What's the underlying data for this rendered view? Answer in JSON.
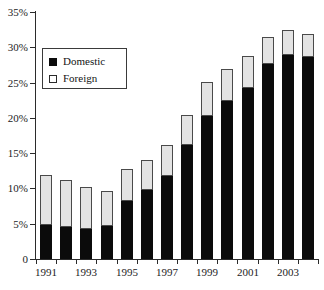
{
  "chart_data": {
    "type": "bar",
    "subtype": "stacked-vertical",
    "title": "",
    "subtitle": "",
    "xlabel": "",
    "ylabel": "",
    "ylim": [
      0,
      35
    ],
    "ytick_values": [
      0,
      5,
      10,
      15,
      20,
      25,
      30,
      35
    ],
    "ytick_labels": [
      "0",
      "5%",
      "10%",
      "15%",
      "20%",
      "25%",
      "30%",
      "35%"
    ],
    "grid": false,
    "legend_position": "upper-left-inside",
    "categories": [
      "1991",
      "1992",
      "1993",
      "1994",
      "1995",
      "1996",
      "1997",
      "1998",
      "1999",
      "2000",
      "2001",
      "2002",
      "2003",
      "2004"
    ],
    "xtick_labels_shown": [
      "1991",
      "1993",
      "1995",
      "1997",
      "1999",
      "2001",
      "2003"
    ],
    "series": [
      {
        "name": "Domestic",
        "color": "#0b0b0b",
        "values": [
          4.8,
          4.6,
          4.3,
          4.7,
          8.2,
          9.8,
          11.8,
          16.2,
          20.3,
          22.4,
          24.3,
          27.7,
          28.9,
          28.6
        ]
      },
      {
        "name": "Foreign",
        "color": "#e3e3e3",
        "values": [
          7.1,
          6.6,
          6.0,
          5.0,
          4.6,
          4.2,
          4.4,
          4.2,
          4.8,
          4.6,
          4.5,
          3.8,
          3.6,
          3.2
        ]
      }
    ],
    "totals": [
      11.9,
      11.2,
      10.3,
      9.7,
      12.8,
      14.0,
      16.2,
      20.4,
      25.1,
      27.0,
      28.8,
      31.5,
      32.5,
      31.8
    ],
    "annotations": []
  },
  "legend": {
    "items": [
      {
        "label": "Domestic",
        "swatch": "filled-black-square"
      },
      {
        "label": "Foreign",
        "swatch": "open-white-square"
      }
    ]
  },
  "caption": {
    "text": ""
  }
}
